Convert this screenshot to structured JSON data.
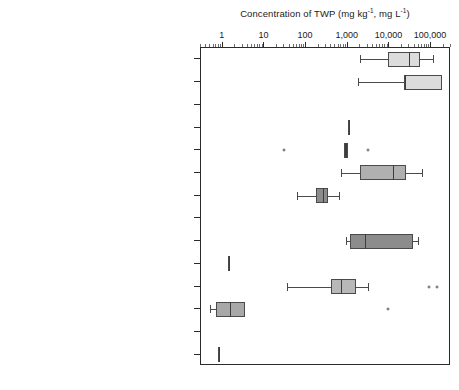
{
  "chart_data": {
    "type": "box",
    "title_main": "Concentration of TWP (mg kg",
    "title_sup1": "-1",
    "title_mid": ", mg L",
    "title_sup2": "-1",
    "title_end": ")",
    "xlabel": "Concentration of TWP (mg kg-1, mg L-1)",
    "ylabel": "",
    "xscale": "log",
    "xlim": [
      0.3,
      300000
    ],
    "grid": false,
    "legend": "none",
    "xticks": [
      {
        "value": 1,
        "label": "1"
      },
      {
        "value": 10,
        "label": "10"
      },
      {
        "value": 100,
        "label": "100"
      },
      {
        "value": 1000,
        "label": "1,000"
      },
      {
        "value": 10000,
        "label": "10,000"
      },
      {
        "value": 100000,
        "label": "100,000"
      }
    ],
    "categories": [
      "Road dust - Road surface",
      "Road dust - Tunnel surface",
      "Tunnel wash water",
      "Roadside snow",
      "Road runoff",
      "Soil: 0-1 m from road",
      "Soil: 8-30 m from road",
      "Soil retention filter",
      "Road sedimentation basin - sediment",
      "Road sedimentation basin - water",
      "River sediment",
      "River water",
      "Lake sediment",
      "Road salt"
    ],
    "boxes": [
      {
        "category": "Road dust - Road surface",
        "whisker_low": 2000,
        "q1": 9000,
        "median": 30000,
        "q3": 55000,
        "whisker_high": 110000,
        "fill": "#dcdcdc",
        "outliers": []
      },
      {
        "category": "Road dust - Tunnel surface",
        "whisker_low": 1800,
        "q1": 22000,
        "median": 22000,
        "q3": 180000,
        "whisker_high": 180000,
        "fill": "#dcdcdc",
        "outliers": []
      },
      {
        "category": "Tunnel wash water",
        "whisker_low": null,
        "q1": null,
        "median": null,
        "q3": null,
        "whisker_high": null,
        "fill": "#9a9a9a",
        "outliers": []
      },
      {
        "category": "Roadside snow",
        "whisker_low": 1000,
        "q1": 1000,
        "median": 1000,
        "q3": 1100,
        "whisker_high": 1100,
        "fill": "#8c8c8c",
        "outliers": []
      },
      {
        "category": "Road runoff",
        "whisker_low": 800,
        "q1": 800,
        "median": 900,
        "q3": 1000,
        "whisker_high": 1000,
        "fill": "#3d3d3d",
        "outliers": [
          30,
          3000
        ]
      },
      {
        "category": "Soil: 0-1 m from road",
        "whisker_low": 700,
        "q1": 2000,
        "median": 12000,
        "q3": 25000,
        "whisker_high": 60000,
        "fill": "#b0b0b0",
        "outliers": []
      },
      {
        "category": "Soil: 8-30 m from road",
        "whisker_low": 60,
        "q1": 170,
        "median": 260,
        "q3": 330,
        "whisker_high": 600,
        "fill": "#8c8c8c",
        "outliers": []
      },
      {
        "category": "Soil retention filter",
        "whisker_low": null,
        "q1": null,
        "median": null,
        "q3": null,
        "whisker_high": null,
        "fill": "#9a9a9a",
        "outliers": []
      },
      {
        "category": "Road sedimentation basin - sediment",
        "whisker_low": 900,
        "q1": 1100,
        "median": 2600,
        "q3": 36000,
        "whisker_high": 48000,
        "fill": "#8c8c8c",
        "outliers": []
      },
      {
        "category": "Road sedimentation basin - water",
        "whisker_low": 1.3,
        "q1": 1.3,
        "median": 1.4,
        "q3": 1.5,
        "whisker_high": 1.5,
        "fill": "#9a9a9a",
        "outliers": []
      },
      {
        "category": "River sediment",
        "whisker_low": 35,
        "q1": 400,
        "median": 700,
        "q3": 1600,
        "whisker_high": 3000,
        "fill": "#b8b8b8",
        "outliers": [
          90000,
          140000
        ]
      },
      {
        "category": "River water",
        "whisker_low": 0.5,
        "q1": 0.7,
        "median": 1.5,
        "q3": 3.5,
        "whisker_high": 3.5,
        "fill": "#a8a8a8",
        "outliers": [
          9000
        ]
      },
      {
        "category": "Lake sediment",
        "whisker_low": null,
        "q1": null,
        "median": null,
        "q3": null,
        "whisker_high": null,
        "fill": "#9a9a9a",
        "outliers": []
      },
      {
        "category": "Road salt",
        "whisker_low": 0.75,
        "q1": 0.75,
        "median": 0.8,
        "q3": 0.85,
        "whisker_high": 0.85,
        "fill": "#c8c8c8",
        "outliers": []
      }
    ]
  },
  "style": {
    "box_edge_color": "#4a4a4a",
    "frame_color": "#2b2b2b",
    "text_color": "#1a1a1a",
    "background": "#ffffff"
  }
}
